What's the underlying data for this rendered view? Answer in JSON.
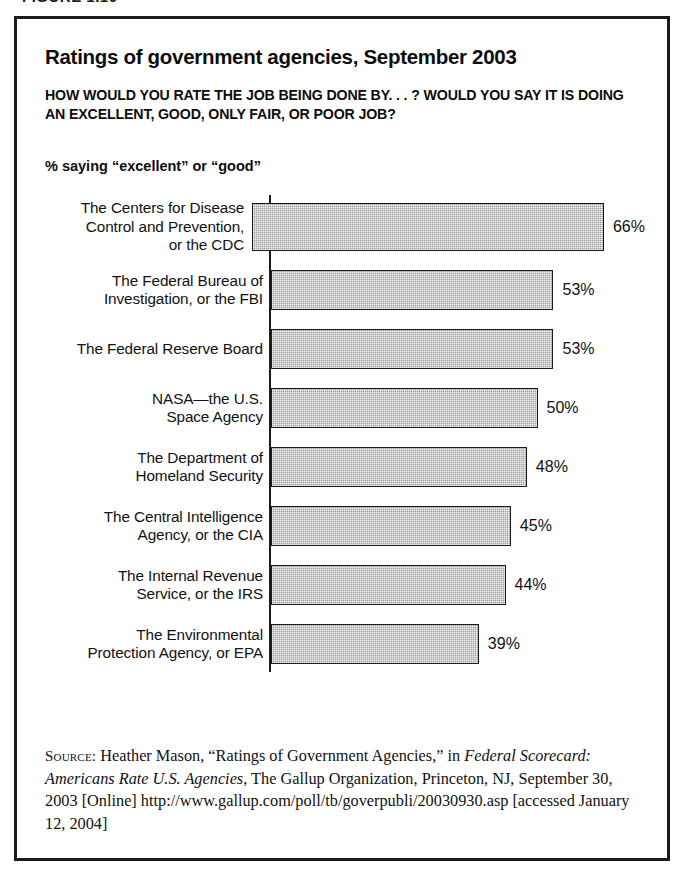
{
  "figure_caption_sliver": "FIGURE 1.10",
  "chart": {
    "title": "Ratings of government agencies, September 2003",
    "question": "HOW WOULD YOU RATE THE JOB BEING DONE BY. . . ? WOULD YOU SAY IT IS DOING AN EXCELLENT, GOOD, ONLY FAIR, OR POOR JOB?",
    "axis_note": "% saying “excellent” or “good”"
  },
  "source": {
    "label": "Source:",
    "part1": " Heather Mason, “Ratings of Government Agencies,” in ",
    "italic1": "Federal Scorecard: Americans Rate U.S. Agencies",
    "part2": ", The Gallup Organization, Princeton, NJ, September 30, 2003 [Online] http://www.gallup.com/poll/tb/goverpubli/20030930.asp [accessed January 12, 2004]"
  },
  "chart_data": {
    "type": "bar",
    "orientation": "horizontal",
    "title": "Ratings of government agencies, September 2003",
    "subtitle": "HOW WOULD YOU RATE THE JOB BEING DONE BY. . . ? WOULD YOU SAY IT IS DOING AN EXCELLENT, GOOD, ONLY FAIR, OR POOR JOB?",
    "xlabel": "% saying “excellent” or “good”",
    "ylabel": "",
    "xlim": [
      0,
      70
    ],
    "grid": false,
    "legend": "none",
    "bar_color": "#9e9e9e",
    "bar_edge_color": "#1b1b1b",
    "categories": [
      "The Centers for Disease Control and Prevention, or the CDC",
      "The Federal Bureau of Investigation, or the FBI",
      "The Federal Reserve Board",
      "NASA—the U.S. Space Agency",
      "The Department of Homeland Security",
      "The Central Intelligence Agency, or the CIA",
      "The Internal Revenue Service, or the IRS",
      "The Environmental Protection Agency, or EPA"
    ],
    "values": [
      66,
      53,
      53,
      50,
      48,
      45,
      44,
      39
    ],
    "value_labels": [
      "66%",
      "53%",
      "53%",
      "50%",
      "48%",
      "45%",
      "44%",
      "39%"
    ]
  },
  "bars": [
    {
      "label": "The Centers for Disease\nControl and Prevention,\nor the CDC",
      "value": 66,
      "value_label": "66%"
    },
    {
      "label": "The Federal Bureau of\nInvestigation, or the FBI",
      "value": 53,
      "value_label": "53%"
    },
    {
      "label": "The Federal Reserve Board",
      "value": 53,
      "value_label": "53%"
    },
    {
      "label": "NASA—the U.S.\nSpace Agency",
      "value": 50,
      "value_label": "50%"
    },
    {
      "label": "The Department of\nHomeland Security",
      "value": 48,
      "value_label": "48%"
    },
    {
      "label": "The Central Intelligence\nAgency, or the CIA",
      "value": 45,
      "value_label": "45%"
    },
    {
      "label": "The Internal Revenue\nService, or the IRS",
      "value": 44,
      "value_label": "44%"
    },
    {
      "label": "The Environmental\nProtection Agency, or EPA",
      "value": 39,
      "value_label": "39%"
    }
  ]
}
